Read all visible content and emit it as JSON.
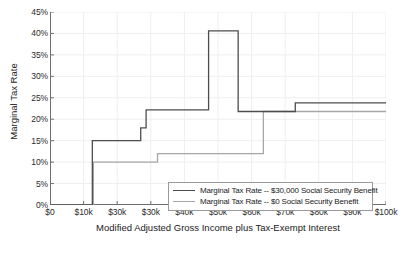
{
  "chart_data": {
    "type": "line",
    "title": "",
    "xlabel": "Modified Adjusted Gross Income plus Tax-Exempt Interest",
    "ylabel": "Marginal Tax Rate",
    "xlim": [
      0,
      100000
    ],
    "ylim": [
      0,
      45
    ],
    "grid": true,
    "legend_position": "lower right",
    "xtick_labels": [
      "$0",
      "$10k",
      "$30k",
      "$30k",
      "$40k",
      "$50k",
      "$60k",
      "$70k",
      "$80k",
      "$90k",
      "$100k"
    ],
    "xtick_values": [
      0,
      10000,
      20000,
      30000,
      40000,
      50000,
      60000,
      70000,
      80000,
      90000,
      100000
    ],
    "ytick_labels": [
      "0%",
      "5%",
      "10%",
      "15%",
      "20%",
      "25%",
      "30%",
      "35%",
      "40%",
      "45%"
    ],
    "ytick_values": [
      0,
      5,
      10,
      15,
      20,
      25,
      30,
      35,
      40,
      45
    ],
    "series": [
      {
        "name": "Marginal Tax Rate -- $30,000 Social Security Benefit",
        "color": "#4d4d4d",
        "step_points": [
          [
            0,
            0
          ],
          [
            12600,
            0
          ],
          [
            12600,
            15.0
          ],
          [
            27000,
            15.0
          ],
          [
            27000,
            18.0
          ],
          [
            28600,
            18.0
          ],
          [
            28600,
            22.2
          ],
          [
            47200,
            22.2
          ],
          [
            47200,
            40.6
          ],
          [
            56000,
            40.6
          ],
          [
            56000,
            21.8
          ],
          [
            73000,
            21.8
          ],
          [
            73000,
            23.8
          ],
          [
            100000,
            23.8
          ]
        ]
      },
      {
        "name": "Marginal Tax Rate -- $0 Social Security Benefit",
        "color": "#a6a6a6",
        "step_points": [
          [
            0,
            0
          ],
          [
            12900,
            0
          ],
          [
            12900,
            10.0
          ],
          [
            32000,
            10.0
          ],
          [
            32000,
            12.0
          ],
          [
            63500,
            12.0
          ],
          [
            63500,
            21.8
          ],
          [
            100000,
            21.8
          ]
        ]
      }
    ]
  },
  "legend": {
    "entries": [
      {
        "label": "Marginal Tax Rate -- $30,000 Social Security Benefit",
        "color": "#4d4d4d"
      },
      {
        "label": "Marginal Tax Rate -- $0 Social Security Benefit",
        "color": "#a6a6a6"
      }
    ]
  },
  "colors": {
    "grid": "#eceff1",
    "axis": "#6f6f6f",
    "text": "#1a1a1a",
    "background": "#ffffff"
  }
}
